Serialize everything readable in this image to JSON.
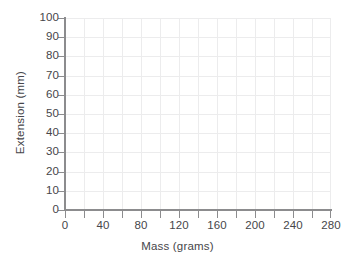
{
  "chart_data": {
    "type": "line",
    "title": "",
    "subtitle": "",
    "xlabel": "Mass (grams)",
    "ylabel": "Extension (mm)",
    "xlim": [
      0,
      280
    ],
    "ylim": [
      0,
      100
    ],
    "x_major_step": 40,
    "x_minor_step": 20,
    "y_major_step": 10,
    "x_tick_labels": [
      "0",
      "40",
      "80",
      "120",
      "160",
      "200",
      "240",
      "280"
    ],
    "x_tick_values": [
      0,
      40,
      80,
      120,
      160,
      200,
      240,
      280
    ],
    "y_tick_labels": [
      "0",
      "10",
      "20",
      "30",
      "40",
      "50",
      "60",
      "70",
      "80",
      "90",
      "100"
    ],
    "y_tick_values": [
      0,
      10,
      20,
      30,
      40,
      50,
      60,
      70,
      80,
      90,
      100
    ],
    "grid": true,
    "grid_x_spacing": 20,
    "grid_y_spacing": 10,
    "legend": false,
    "legend_position": "none",
    "series": [],
    "annotations": []
  },
  "style": {
    "background_color": "#ffffff",
    "grid_color": "#ececed",
    "axis_color": "#8c8c8e",
    "text_color": "#46464a"
  }
}
